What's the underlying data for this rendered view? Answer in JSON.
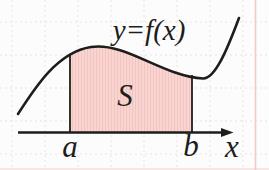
{
  "figure": {
    "function_label": "y=f(x)",
    "region_label": "S",
    "lower_bound_label": "a",
    "upper_bound_label": "b",
    "axis_label": "x"
  },
  "colors": {
    "background": "#fdfcfc",
    "ink": "#1d1d1b",
    "region_fill": "#f9d5d1",
    "region_stripe": "#f3c5c1",
    "grid": "#ebe2e2",
    "page_margin_line": "#f1c9c7"
  }
}
